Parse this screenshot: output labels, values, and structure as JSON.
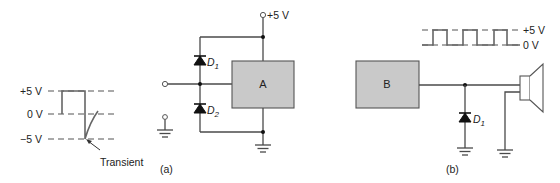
{
  "figure": {
    "panel_a_label": "(a)",
    "panel_b_label": "(b)"
  },
  "waveform_a": {
    "levels": [
      "+5 V",
      "0 V",
      "−5 V"
    ],
    "annotation": "Transient"
  },
  "circuit_a": {
    "supply_label": "+5 V",
    "block_label": "A",
    "diode_top": {
      "name": "D",
      "subscript": "1"
    },
    "diode_bottom": {
      "name": "D",
      "subscript": "2"
    }
  },
  "waveform_b": {
    "levels": [
      "+5 V",
      "0 V"
    ],
    "pulses": 3
  },
  "circuit_b": {
    "block_label": "B",
    "diode": {
      "name": "D",
      "subscript": "1"
    },
    "load": "speaker-icon"
  },
  "colors": {
    "block_fill": "#c9c9c9",
    "wire": "#4a4a4a"
  }
}
